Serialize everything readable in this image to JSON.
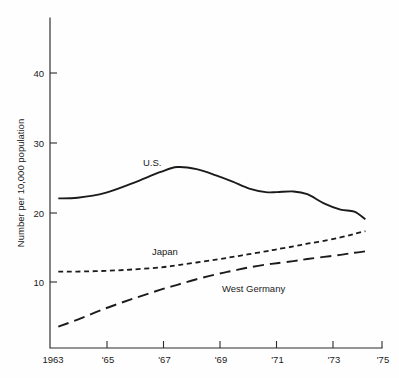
{
  "chart_data": {
    "type": "line",
    "title": "",
    "subtitle": "",
    "xlabel": "",
    "ylabel": "Number per 10,000 population",
    "xlim": [
      1963,
      1975
    ],
    "ylim": [
      0,
      48
    ],
    "grid": false,
    "legend_position": "inline-annotations",
    "x_tick_labels": [
      "1963",
      "'65",
      "'67",
      "'69",
      "'71",
      "'73",
      "'75"
    ],
    "x_tick_values": [
      1963,
      1965,
      1967,
      1969,
      1971,
      1973,
      1975
    ],
    "y_tick_labels": [
      "10",
      "20",
      "30",
      "40"
    ],
    "y_tick_values": [
      10,
      20,
      30,
      40
    ],
    "x": [
      1963.3,
      1964,
      1965,
      1966,
      1967,
      1967.6,
      1968.3,
      1969,
      1969.6,
      1970.2,
      1970.8,
      1971.2,
      1971.8,
      1972.3,
      1972.9,
      1973.5,
      1974,
      1974.4
    ],
    "series": [
      {
        "name": "U.S.",
        "style": "solid",
        "label": "U.S.",
        "values": [
          22.0,
          22.1,
          22.8,
          24.2,
          25.8,
          26.5,
          26.2,
          25.3,
          24.4,
          23.4,
          22.9,
          22.9,
          23.0,
          22.6,
          21.3,
          20.4,
          20.1,
          19.0
        ]
      },
      {
        "name": "Japan",
        "style": "short-dash",
        "label": "Japan",
        "values": [
          11.5,
          11.5,
          11.6,
          11.8,
          12.1,
          12.4,
          12.8,
          13.2,
          13.6,
          14.0,
          14.4,
          14.7,
          15.1,
          15.5,
          15.9,
          16.4,
          16.9,
          17.3
        ]
      },
      {
        "name": "West Germany",
        "style": "long-dash",
        "label": "West Germany",
        "values": [
          3.6,
          4.6,
          6.2,
          7.6,
          8.9,
          9.6,
          10.4,
          11.1,
          11.6,
          12.1,
          12.5,
          12.7,
          13.0,
          13.3,
          13.6,
          13.9,
          14.2,
          14.4
        ]
      }
    ],
    "annotations": [
      {
        "text": "U.S.",
        "x": 1966.1,
        "y": 28.2
      },
      {
        "text": "Japan",
        "x": 1966.3,
        "y": 13.7
      },
      {
        "text": "West Germany",
        "x": 1970.2,
        "y": 10.2
      }
    ]
  }
}
